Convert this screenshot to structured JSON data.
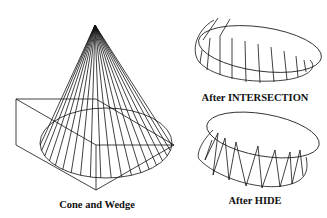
{
  "figure": {
    "panels": [
      {
        "id": "cone-and-wedge",
        "caption": "Cone and Wedge"
      },
      {
        "id": "after-intersection",
        "caption": "After INTERSECTION"
      },
      {
        "id": "after-hide",
        "caption": "After HIDE"
      }
    ],
    "line_color": "#111111",
    "background": "#ffffff",
    "cone_generator_lines": 20
  }
}
